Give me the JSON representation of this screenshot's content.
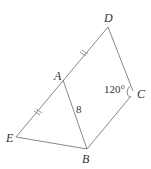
{
  "figure": {
    "points": {
      "A": {
        "label": "A",
        "x": 63,
        "y": 80
      },
      "B": {
        "label": "B",
        "x": 87,
        "y": 149
      },
      "C": {
        "label": "C",
        "x": 133,
        "y": 93
      },
      "D": {
        "label": "D",
        "x": 108,
        "y": 27
      },
      "E": {
        "label": "E",
        "x": 16,
        "y": 137
      }
    },
    "segment_AB_label": "8",
    "angle_C_label": "120°",
    "stroke_color": "#7a7a7a",
    "text_color": "#333333"
  }
}
